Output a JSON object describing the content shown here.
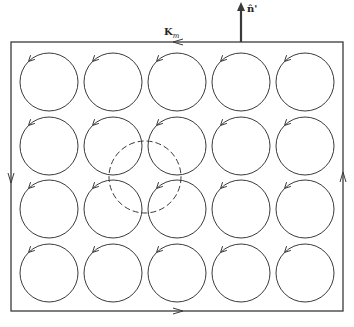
{
  "diagram": {
    "title": "",
    "labels": {
      "surface_current": "K",
      "surface_current_sub": "m",
      "normal": "n̂'"
    },
    "colors": {
      "stroke": "#3a3a3a",
      "background": "#ffffff"
    },
    "boundary": {
      "x": 11,
      "y": 42,
      "width": 332,
      "height": 269,
      "circulation": "counterclockwise",
      "edge_arrows": [
        {
          "edge": "top",
          "direction": "left",
          "x": 178,
          "y": 42
        },
        {
          "edge": "left",
          "direction": "down",
          "x": 11,
          "y": 178
        },
        {
          "edge": "bottom",
          "direction": "right",
          "x": 178,
          "y": 311
        },
        {
          "edge": "right",
          "direction": "up",
          "x": 343,
          "y": 177
        }
      ]
    },
    "normal_vector": {
      "x": 241,
      "y_start": 42,
      "y_end": 2
    },
    "current_loops": {
      "rows": 4,
      "cols": 5,
      "centers_x": [
        49,
        113,
        177,
        241,
        305
      ],
      "centers_y": [
        82,
        146,
        209,
        273
      ],
      "radius": 29,
      "circulation": "counterclockwise"
    },
    "dashed_circle": {
      "cx": 145,
      "cy": 177,
      "r": 36
    }
  }
}
